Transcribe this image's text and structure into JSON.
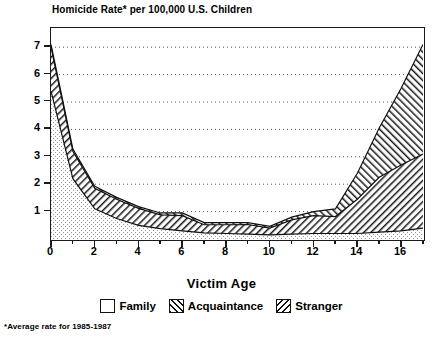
{
  "chart_data": {
    "type": "area",
    "title": "Homicide Rate* per 100,000 U.S. Children",
    "subtitle": "",
    "xlabel": "Victim Age",
    "ylabel": "",
    "xlim": [
      0,
      17
    ],
    "ylim": [
      0,
      7.7
    ],
    "grid": "horizontal dotted gridlines at each integer y value",
    "legend_position": "below plot, centered",
    "stacked": true,
    "x": [
      0,
      1,
      2,
      3,
      4,
      5,
      6,
      7,
      8,
      9,
      10,
      11,
      12,
      13,
      14,
      15,
      16,
      17
    ],
    "xticks": [
      0,
      2,
      4,
      6,
      8,
      10,
      12,
      14,
      16
    ],
    "yticks": [
      1,
      2,
      3,
      4,
      5,
      6,
      7
    ],
    "series": [
      {
        "name": "Family",
        "pattern": "stipple-white",
        "values": [
          5.4,
          2.2,
          1.1,
          0.75,
          0.5,
          0.38,
          0.3,
          0.22,
          0.2,
          0.18,
          0.15,
          0.18,
          0.2,
          0.2,
          0.2,
          0.25,
          0.3,
          0.4
        ]
      },
      {
        "name": "Acquaintance",
        "pattern": "forward-hatch",
        "values": [
          1.6,
          1.0,
          0.75,
          0.7,
          0.62,
          0.5,
          0.55,
          0.3,
          0.32,
          0.35,
          0.25,
          0.52,
          0.65,
          0.62,
          1.25,
          2.0,
          2.4,
          2.7
        ]
      },
      {
        "name": "Stranger",
        "pattern": "back-hatch",
        "values": [
          0.1,
          0.08,
          0.07,
          0.07,
          0.06,
          0.07,
          0.1,
          0.08,
          0.08,
          0.07,
          0.06,
          0.1,
          0.15,
          0.28,
          0.95,
          1.8,
          2.8,
          4.0
        ]
      }
    ],
    "totals": [
      7.1,
      3.28,
      1.92,
      1.52,
      1.18,
      0.95,
      0.95,
      0.6,
      0.6,
      0.6,
      0.46,
      0.8,
      1.0,
      1.1,
      2.4,
      4.05,
      5.5,
      7.1
    ],
    "annotations": [
      "*Average rate for 1985-1987"
    ]
  },
  "legend": {
    "items": [
      {
        "label": "Family",
        "pattern": "empty"
      },
      {
        "label": "Acquaintance",
        "pattern": "forward-hatch"
      },
      {
        "label": "Stranger",
        "pattern": "back-hatch"
      }
    ]
  },
  "footnote": "*Average rate for 1985-1987",
  "colors": {
    "ink": "#111111",
    "background": "#ffffff",
    "gridline": "#555555"
  }
}
